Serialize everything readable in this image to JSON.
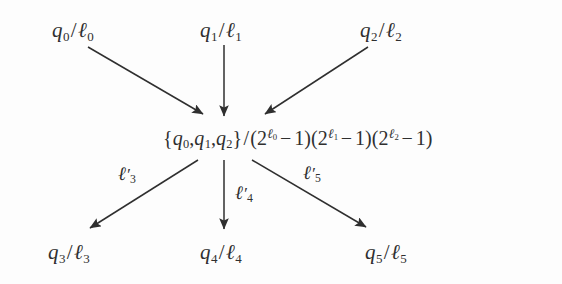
{
  "figure": {
    "kind": "mathematical-flow-diagram",
    "width": 562,
    "height": 284,
    "background_color": "#fdfdfd",
    "ink_color": "#2f2f2f"
  },
  "nodes": {
    "top": [
      {
        "id": "q0",
        "q": "q",
        "q_sub": "0",
        "ell_sub": "0",
        "text": "q0/ℓ0"
      },
      {
        "id": "q1",
        "q": "q",
        "q_sub": "1",
        "ell_sub": "1",
        "text": "q1/ℓ1"
      },
      {
        "id": "q2",
        "q": "q",
        "q_sub": "2",
        "ell_sub": "2",
        "text": "q2/ℓ2"
      }
    ],
    "bottom": [
      {
        "id": "q3",
        "q": "q",
        "q_sub": "3",
        "ell_sub": "3",
        "text": "q3/ℓ3"
      },
      {
        "id": "q4",
        "q": "q",
        "q_sub": "4",
        "ell_sub": "4",
        "text": "q4/ℓ4"
      },
      {
        "id": "q5",
        "q": "q",
        "q_sub": "5",
        "ell_sub": "5",
        "text": "q5/ℓ5"
      }
    ],
    "center": {
      "id": "center",
      "text": "{q0, q1, q2}/(2^ℓ0 − 1)(2^ℓ1 − 1)(2^ℓ2 − 1)",
      "set": {
        "open": "{",
        "close": "}",
        "members": [
          {
            "base": "q",
            "sub": "0"
          },
          {
            "base": "q",
            "sub": "1"
          },
          {
            "base": "q",
            "sub": "2"
          }
        ],
        "separator": ","
      },
      "divider": "/",
      "factors": [
        {
          "open": "(",
          "base": "2",
          "exp_base": "ℓ",
          "exp_sub": "0",
          "operator": "−",
          "constant": "1",
          "close": ")"
        },
        {
          "open": "(",
          "base": "2",
          "exp_base": "ℓ",
          "exp_sub": "1",
          "operator": "−",
          "constant": "1",
          "close": ")"
        },
        {
          "open": "(",
          "base": "2",
          "exp_base": "ℓ",
          "exp_sub": "2",
          "operator": "−",
          "constant": "1",
          "close": ")"
        }
      ]
    }
  },
  "edge_labels": [
    {
      "id": "l3",
      "base": "ℓ",
      "prime": "′",
      "sub": "3",
      "text": "ℓ′3"
    },
    {
      "id": "l4",
      "base": "ℓ",
      "prime": "′",
      "sub": "4",
      "text": "ℓ′4"
    },
    {
      "id": "l5",
      "base": "ℓ",
      "prime": "′",
      "sub": "5",
      "text": "ℓ′5"
    }
  ],
  "arrows": [
    {
      "id": "q0-to-center",
      "from": "q0",
      "to": "center",
      "x1": 88,
      "y1": 47,
      "x2": 203,
      "y2": 116,
      "labeled": false
    },
    {
      "id": "q1-to-center",
      "from": "q1",
      "to": "center",
      "x1": 224,
      "y1": 45,
      "x2": 224,
      "y2": 118,
      "labeled": false
    },
    {
      "id": "q2-to-center",
      "from": "q2",
      "to": "center",
      "x1": 368,
      "y1": 47,
      "x2": 263,
      "y2": 116,
      "labeled": false
    },
    {
      "id": "center-to-q3",
      "from": "center",
      "to": "q3",
      "x1": 198,
      "y1": 160,
      "x2": 88,
      "y2": 230,
      "labeled": true,
      "label": "l3"
    },
    {
      "id": "center-to-q4",
      "from": "center",
      "to": "q4",
      "x1": 224,
      "y1": 160,
      "x2": 224,
      "y2": 231,
      "labeled": true,
      "label": "l4"
    },
    {
      "id": "center-to-q5",
      "from": "center",
      "to": "q5",
      "x1": 252,
      "y1": 160,
      "x2": 368,
      "y2": 229,
      "labeled": true,
      "label": "l5"
    }
  ]
}
